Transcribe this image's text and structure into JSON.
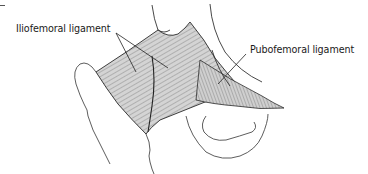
{
  "figure": {
    "labels": [
      {
        "id": "iliofemoral",
        "text": "Iliofemoral ligament"
      },
      {
        "id": "pubofemoral",
        "text": "Pubofemoral ligament"
      }
    ],
    "colors": {
      "background": "#ffffff",
      "line": "#2a2a2a",
      "ligament_fill": "#c9c9c9",
      "text": "#1a1a1a"
    }
  }
}
